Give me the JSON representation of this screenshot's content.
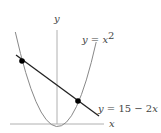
{
  "diagram": {
    "axes": {
      "x_label": "x",
      "y_label": "y"
    },
    "curves": [
      {
        "name": "parabola",
        "label_lhs": "y = x",
        "label_exp": "2"
      },
      {
        "name": "line",
        "label_y": "y",
        "label_eq": " = 15 − 2",
        "label_x": "x"
      }
    ],
    "intersections": [
      {
        "x": -5,
        "y": 25
      },
      {
        "x": 3,
        "y": 9
      }
    ],
    "colors": {
      "axis": "#b0b0b0",
      "parabola": "#888888",
      "line": "#222222",
      "point": "#000000"
    }
  }
}
